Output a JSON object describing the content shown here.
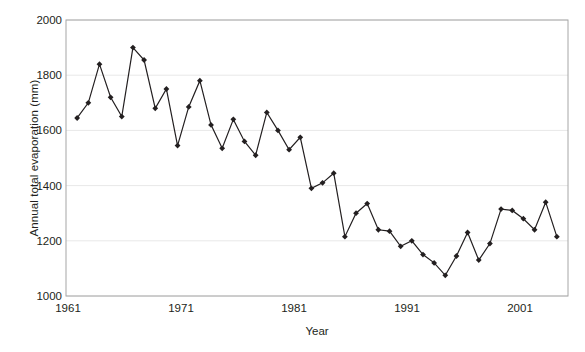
{
  "chart_data": {
    "type": "line",
    "title": "",
    "xlabel": "Year",
    "ylabel": "Annual total evaporation (mm)",
    "xlim": [
      1960,
      2005
    ],
    "ylim": [
      1000,
      2000
    ],
    "xticks": [
      1961,
      1971,
      1981,
      1991,
      2001
    ],
    "yticks": [
      1000,
      1200,
      1400,
      1600,
      1800,
      2000
    ],
    "grid": "horizontal",
    "legend": "none",
    "marker": "diamond",
    "line_color": "#231f20",
    "marker_color": "#231f20",
    "x": [
      1961,
      1962,
      1963,
      1964,
      1965,
      1966,
      1967,
      1968,
      1969,
      1970,
      1971,
      1972,
      1973,
      1974,
      1975,
      1976,
      1977,
      1978,
      1979,
      1980,
      1981,
      1982,
      1983,
      1984,
      1985,
      1986,
      1987,
      1988,
      1989,
      1990,
      1991,
      1992,
      1993,
      1994,
      1995,
      1996,
      1997,
      1998,
      1999,
      2000,
      2001,
      2002,
      2003,
      2004
    ],
    "values": [
      1645,
      1700,
      1840,
      1720,
      1650,
      1900,
      1855,
      1680,
      1750,
      1545,
      1685,
      1780,
      1620,
      1535,
      1640,
      1560,
      1510,
      1665,
      1600,
      1530,
      1575,
      1390,
      1410,
      1445,
      1215,
      1300,
      1335,
      1240,
      1235,
      1180,
      1200,
      1150,
      1120,
      1075,
      1145,
      1230,
      1130,
      1190,
      1315,
      1310,
      1280,
      1240,
      1340,
      1215
    ]
  },
  "axes": {
    "border_color": "#a6a6a6",
    "grid_color": "#e8e8e8",
    "background": "#ffffff"
  }
}
